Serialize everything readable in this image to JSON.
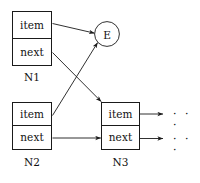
{
  "diagram": {
    "stroke_color": "#1a1a1a",
    "text_color": "#111111",
    "background": "#ffffff",
    "nodes": [
      {
        "id": "N1",
        "label": "N1",
        "fields": {
          "item": "item",
          "next": "next"
        }
      },
      {
        "id": "N2",
        "label": "N2",
        "fields": {
          "item": "item",
          "next": "next"
        }
      },
      {
        "id": "N3",
        "label": "N3",
        "fields": {
          "item": "item",
          "next": "next"
        }
      }
    ],
    "element_node": {
      "id": "E",
      "label": "E"
    },
    "continuations": [
      {
        "id": "item-continuation",
        "label": "· · ·"
      },
      {
        "id": "next-continuation",
        "label": "· · ·"
      }
    ],
    "edges": [
      {
        "from": "N1.item",
        "to": "E"
      },
      {
        "from": "N1.next",
        "to": "N3"
      },
      {
        "from": "N2.item",
        "to": "E"
      },
      {
        "from": "N2.next",
        "to": "N3"
      },
      {
        "from": "N3.item",
        "to": "item-continuation"
      },
      {
        "from": "N3.next",
        "to": "next-continuation"
      }
    ]
  }
}
